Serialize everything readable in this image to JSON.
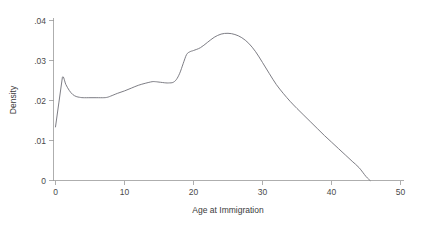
{
  "chart_data": {
    "type": "line",
    "title": "",
    "subtitle": "",
    "xlabel": "Age at Immigration",
    "ylabel": "Density",
    "xlim": [
      0,
      50
    ],
    "ylim": [
      0,
      0.04
    ],
    "grid": false,
    "legend": null,
    "legend_position": "none",
    "xticks": [
      0,
      10,
      20,
      30,
      40,
      50
    ],
    "xtick_labels": [
      "0",
      "10",
      "20",
      "30",
      "40",
      "50"
    ],
    "yticks": [
      0,
      0.01,
      0.02,
      0.03,
      0.04
    ],
    "ytick_labels": [
      "0",
      ".01",
      ".02",
      ".03",
      ".04"
    ],
    "series": [
      {
        "name": "Density",
        "color": "#6e6e76",
        "x": [
          0,
          0.5,
          1.0,
          1.5,
          2.0,
          2.5,
          3.0,
          3.5,
          4.0,
          5.0,
          6.0,
          7.0,
          7.5,
          8.0,
          9.0,
          10.0,
          11.0,
          12.0,
          13.0,
          14.0,
          14.5,
          15.0,
          16.0,
          16.5,
          17.0,
          17.5,
          18.0,
          18.5,
          19.0,
          19.5,
          20.0,
          21.0,
          22.0,
          23.0,
          24.0,
          25.0,
          26.0,
          27.0,
          28.0,
          29.0,
          30.0,
          31.0,
          32.0,
          33.0,
          34.0,
          35.0,
          36.0,
          37.0,
          38.0,
          39.0,
          40.0,
          41.0,
          42.0,
          43.0,
          44.0,
          45.0,
          45.6
        ],
        "y": [
          0.0134,
          0.0196,
          0.0258,
          0.024,
          0.0225,
          0.0215,
          0.021,
          0.0208,
          0.0207,
          0.0207,
          0.0207,
          0.0207,
          0.0208,
          0.0211,
          0.0218,
          0.0224,
          0.0231,
          0.0238,
          0.0243,
          0.0247,
          0.0247,
          0.0246,
          0.0244,
          0.0244,
          0.0245,
          0.0252,
          0.0268,
          0.0292,
          0.0315,
          0.0322,
          0.0325,
          0.0332,
          0.0345,
          0.0358,
          0.0366,
          0.0368,
          0.0365,
          0.0357,
          0.0343,
          0.0322,
          0.0295,
          0.0267,
          0.024,
          0.0218,
          0.0198,
          0.018,
          0.0163,
          0.0146,
          0.0129,
          0.0112,
          0.0096,
          0.008,
          0.0064,
          0.0048,
          0.0032,
          0.001,
          0.0
        ]
      }
    ],
    "annotations": []
  },
  "axes": {
    "x_title": "Age at Immigration",
    "y_title": "Density"
  },
  "colors": {
    "curve": "#6e6e76",
    "axis": "#9a9a9a",
    "text": "#3a3a3a",
    "background": "#ffffff"
  }
}
